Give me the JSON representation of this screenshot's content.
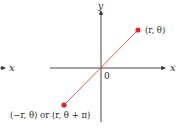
{
  "diagram": {
    "type": "polar-coordinates-point-reflection",
    "axes": {
      "x_label": "x",
      "y_label": "y",
      "origin_label": "0",
      "left_fragment_label": "x"
    },
    "points": [
      {
        "id": "p1",
        "label": "(r, θ)",
        "position": "first-quadrant"
      },
      {
        "id": "p2",
        "label": "(−r, θ) or (r, θ + π)",
        "position": "third-quadrant"
      }
    ],
    "colors": {
      "axis": "#333333",
      "point": "#e0242b",
      "segment": "#e05a5a",
      "text": "#2a2a2a"
    }
  }
}
